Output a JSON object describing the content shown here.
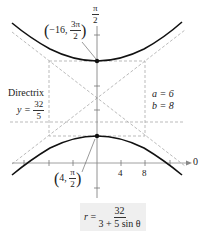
{
  "diagram": {
    "type": "polar hyperbola graph",
    "equation": {
      "lhs": "r",
      "equals": "=",
      "numerator": "32",
      "denominator": "3 + 5 sin θ"
    },
    "axis_labels": {
      "top": {
        "num": "π",
        "den": "2"
      },
      "right": "0"
    },
    "x_ticks": [
      "4",
      "8"
    ],
    "vertex_top": {
      "open": "(",
      "r": "−16,",
      "theta_num": "3π",
      "theta_den": "2",
      "close": ")"
    },
    "vertex_bottom": {
      "open": "(",
      "r": "4,",
      "theta_num": "π",
      "theta_den": "2",
      "close": ")"
    },
    "directrix": {
      "title": "Directrix",
      "lhs": "y =",
      "num": "32",
      "den": "5"
    },
    "params": {
      "a": "a = 6",
      "b": "b = 8"
    },
    "colors": {
      "curve": "#111111",
      "axis": "#666666",
      "dashed": "#aaaaaa",
      "formula_bg": "#efefef"
    }
  }
}
